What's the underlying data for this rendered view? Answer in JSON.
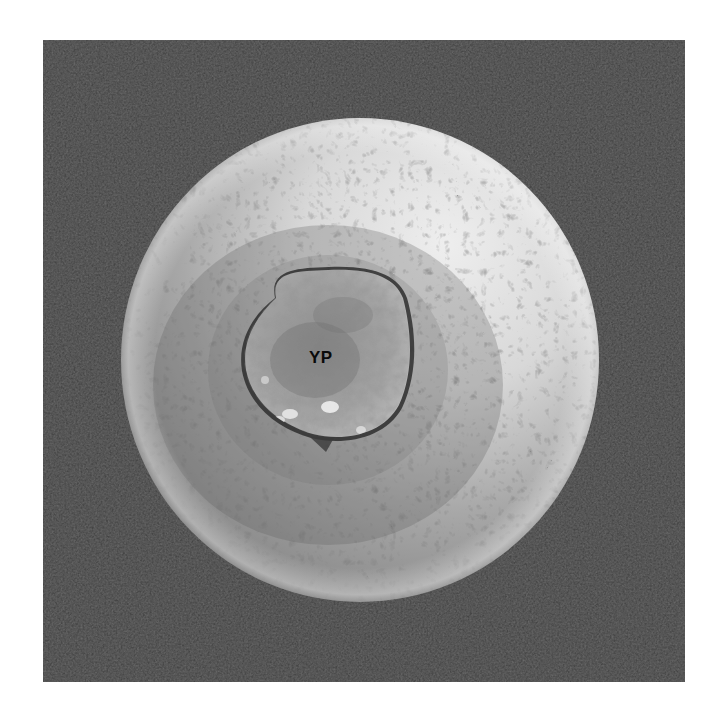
{
  "figure": {
    "type": "scanning electron micrograph",
    "colors": {
      "page_background": "#ffffff",
      "image_background": "#454545",
      "sphere_highlight": "#e6e6e6",
      "sphere_shadow": "#7c7c7c",
      "yolk_plug": "#9c9c9c",
      "label_color": "#0a0a0a"
    },
    "labels": [
      {
        "id": "yolk-plug-label",
        "text": "YP",
        "x": 322,
        "y": 357
      }
    ]
  }
}
